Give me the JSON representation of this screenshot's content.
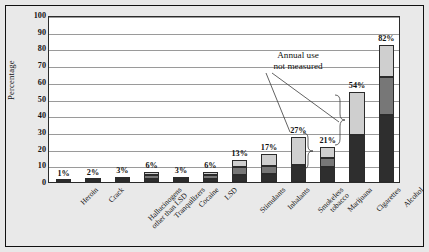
{
  "chart_data": {
    "type": "bar",
    "title": "Tenth-graders",
    "xlabel": "",
    "ylabel": "Percentage",
    "ylim": [
      0,
      100
    ],
    "ytick_step": 10,
    "grid": true,
    "legend": null,
    "stacked": true,
    "categories": [
      "Heroin",
      "Crack",
      "Hallucinogens\nother than LSD",
      "Tranquilizers",
      "Cocaine",
      "LSD",
      "Stimulants",
      "Inhalants",
      "Smokeless\ntobacco",
      "Marijuana",
      "Cigarettes",
      "Alcohol"
    ],
    "value_labels": [
      "1%",
      "2%",
      "3%",
      "6%",
      "3%",
      "6%",
      "13%",
      "17%",
      "27%",
      "21%",
      "54%",
      "82%"
    ],
    "values": [
      1,
      2,
      3,
      6,
      3,
      6,
      13,
      17,
      27,
      21,
      54,
      82
    ],
    "series": [
      {
        "name": "30-day use",
        "shade": "dark",
        "values": [
          0.4,
          0.8,
          1.0,
          2.0,
          1.0,
          1.8,
          4.5,
          5.0,
          10.0,
          9.0,
          28.0,
          40.0
        ]
      },
      {
        "name": "Annual use",
        "shade": "mid",
        "values": [
          0.3,
          0.6,
          1.0,
          2.0,
          1.0,
          2.2,
          4.5,
          4.5,
          0,
          5.5,
          0,
          23.0
        ]
      },
      {
        "name": "Lifetime use",
        "shade": "light",
        "values": [
          0.3,
          0.6,
          1.0,
          2.0,
          1.0,
          2.0,
          4.0,
          7.5,
          17.0,
          6.5,
          26.0,
          19.0
        ]
      }
    ],
    "annotations": [
      {
        "text": "Annual use\nnot measured",
        "line1": "Annual use",
        "line2": "not measured",
        "targets": [
          "Smokeless tobacco",
          "Cigarettes"
        ]
      }
    ]
  },
  "colors": {
    "dark_segment": "#2e2e2e",
    "mid_segment": "#777777",
    "light_segment": "#cfcfcf",
    "plot_background": "#ffffff",
    "figure_background": "#e8e8e8",
    "gridline": "#9a9a9a",
    "axis": "#2b2b2b",
    "text": "#111111"
  }
}
